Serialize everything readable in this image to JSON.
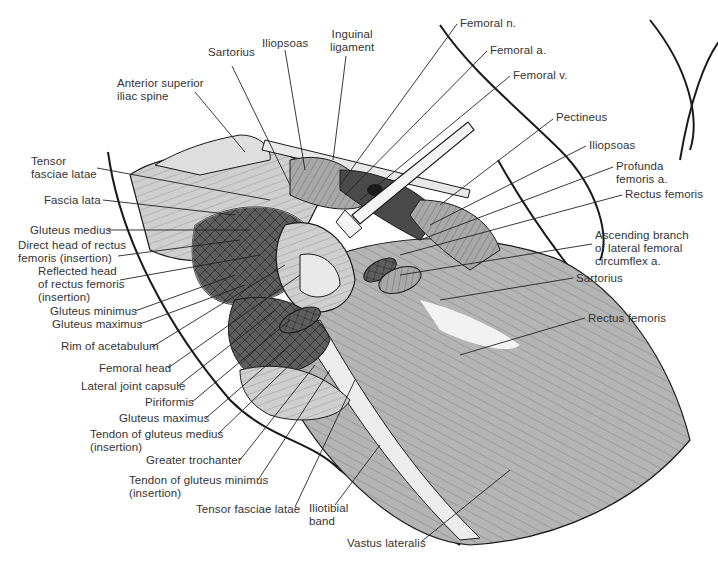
{
  "figure": {
    "colors": {
      "line": "#1a1a1a",
      "muscle_light": "#c8c8c8",
      "muscle_mid": "#9a9a9a",
      "muscle_dark": "#5a5a5a",
      "bone": "#e6e6e6",
      "background": "#ffffff"
    }
  },
  "labels": {
    "top": [
      {
        "text": "Sartorius",
        "x": 208,
        "y": 52
      },
      {
        "text": "Iliopsoas",
        "x": 263,
        "y": 36
      },
      {
        "text": "Inguinal\nligament",
        "x": 329,
        "y": 28
      },
      {
        "text": "Anterior superior\niliac spine",
        "x": 117,
        "y": 77
      }
    ],
    "right": [
      {
        "text": "Femoral n.",
        "x": 460,
        "y": 18
      },
      {
        "text": "Femoral a.",
        "x": 490,
        "y": 45
      },
      {
        "text": "Femoral v.",
        "x": 513,
        "y": 70
      },
      {
        "text": "Pectineus",
        "x": 556,
        "y": 113
      },
      {
        "text": "Iliopsoas",
        "x": 589,
        "y": 140
      },
      {
        "text": "Profunda\nfemoris a.",
        "x": 616,
        "y": 160
      },
      {
        "text": "Rectus femoris",
        "x": 625,
        "y": 189
      },
      {
        "text": "Ascending branch\nof lateral femoral\ncircumflex a.",
        "x": 595,
        "y": 230
      },
      {
        "text": "Sartorius",
        "x": 576,
        "y": 272
      },
      {
        "text": "Rectus femoris",
        "x": 588,
        "y": 312
      }
    ],
    "left": [
      {
        "text": "Tensor\nfasciae latae",
        "x": 31,
        "y": 155
      },
      {
        "text": "Fascia lata",
        "x": 44,
        "y": 194
      },
      {
        "text": "Gluteus medius",
        "x": 30,
        "y": 224
      },
      {
        "text": "Direct head of rectus\nfemoris (insertion)",
        "x": 18,
        "y": 239
      },
      {
        "text": "Reflected head\nof rectus femoris\n(insertion)",
        "x": 38,
        "y": 265
      },
      {
        "text": "Gluteus minimus",
        "x": 50,
        "y": 305
      },
      {
        "text": "Gluteus maximus",
        "x": 52,
        "y": 318
      },
      {
        "text": "Rim of acetabulum",
        "x": 61,
        "y": 341
      },
      {
        "text": "Femoral head",
        "x": 99,
        "y": 362
      },
      {
        "text": "Lateral joint capsule",
        "x": 81,
        "y": 380
      },
      {
        "text": "Piriformis",
        "x": 145,
        "y": 396
      },
      {
        "text": "Gluteus maximus",
        "x": 119,
        "y": 412
      },
      {
        "text": "Tendon of gluteus medius\n(insertion)",
        "x": 90,
        "y": 428
      },
      {
        "text": "Greater trochanter",
        "x": 146,
        "y": 454
      },
      {
        "text": "Tendon of gluteus minimus\n(insertion)",
        "x": 129,
        "y": 474
      }
    ],
    "bottom": [
      {
        "text": "Tensor fasciae latae",
        "x": 196,
        "y": 503
      },
      {
        "text": "Iliotibial\nband",
        "x": 309,
        "y": 502
      },
      {
        "text": "Vastus lateralis",
        "x": 347,
        "y": 537
      }
    ]
  }
}
